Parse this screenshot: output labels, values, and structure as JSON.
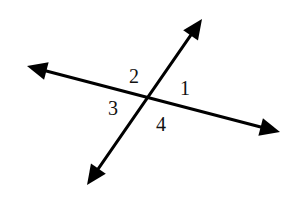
{
  "diagram": {
    "type": "intersecting-lines",
    "intersection": {
      "x": 148,
      "y": 98
    },
    "lines": [
      {
        "name": "line-a",
        "from": {
          "x": 27,
          "y": 66
        },
        "to": {
          "x": 280,
          "y": 132
        },
        "arrows": "both"
      },
      {
        "name": "line-b",
        "from": {
          "x": 87,
          "y": 185
        },
        "to": {
          "x": 202,
          "y": 19
        },
        "arrows": "both"
      }
    ],
    "angle_labels": [
      {
        "id": "1",
        "text": "1",
        "x": 185,
        "y": 88
      },
      {
        "id": "2",
        "text": "2",
        "x": 134,
        "y": 76
      },
      {
        "id": "3",
        "text": "3",
        "x": 113,
        "y": 108
      },
      {
        "id": "4",
        "text": "4",
        "x": 161,
        "y": 124
      }
    ],
    "colors": {
      "line": "#000000",
      "background": "#ffffff"
    }
  }
}
